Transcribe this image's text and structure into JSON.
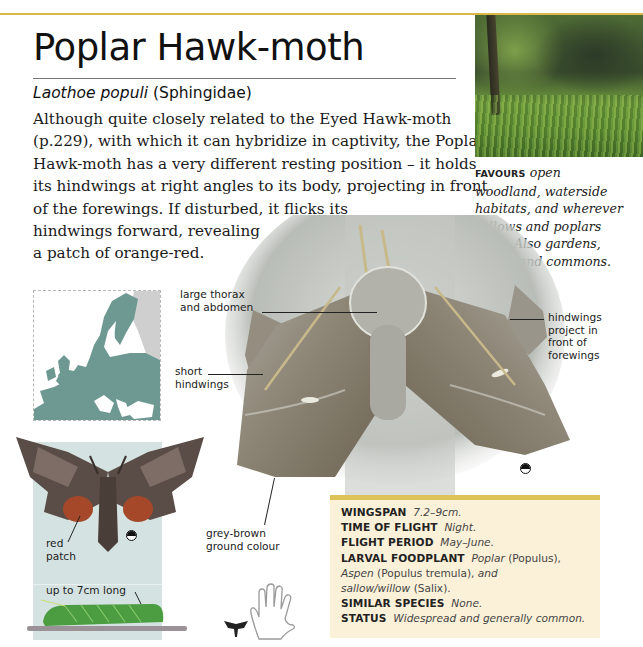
{
  "page": {
    "title": "Poplar Hawk-moth",
    "scientific_name": "Laothoe populi",
    "family": "(Sphingidae)",
    "intro_lines": [
      "Although quite closely related to the Eyed Hawk-moth",
      "(p.229), with which it can hybridize in captivity, the Poplar",
      "Hawk-moth has a very different resting position – it holds",
      "its hindwings at right angles to its body, projecting in front",
      "of the forewings. If disturbed, it flicks its",
      "hindwings forward, revealing",
      "a patch of orange-red."
    ]
  },
  "habitat": {
    "label": "FAVOURS",
    "text_lines": [
      "open",
      "woodland, waterside",
      "habitats, and wherever",
      "sallows and poplars",
      "grow. Also gardens,",
      "parks, and commons."
    ]
  },
  "annotations": {
    "thorax": [
      "large thorax",
      "and abdomen"
    ],
    "short_hindwings": [
      "short",
      "hindwings"
    ],
    "hindwings_project": [
      "hindwings",
      "project in",
      "front of",
      "forewings"
    ],
    "ground_colour": [
      "grey-brown",
      "ground colour"
    ],
    "red_patch": [
      "red",
      "patch"
    ],
    "caterpillar": "up to 7cm long"
  },
  "facts": [
    {
      "key": "WINGSPAN",
      "value": "7.2–9cm."
    },
    {
      "key": "TIME OF FLIGHT",
      "value": "Night."
    },
    {
      "key": "FLIGHT PERIOD",
      "value": "May–June."
    },
    {
      "key": "LARVAL FOODPLANT",
      "value_parts": [
        "Poplar",
        " (Populus),",
        "Aspen",
        " (Populus tremula), ",
        "and",
        "sallow/willow",
        " (Salix)."
      ]
    },
    {
      "key": "SIMILAR SPECIES",
      "value": "None."
    },
    {
      "key": "STATUS",
      "value": "Widespread and generally common."
    }
  ],
  "icons": {
    "sex_symbol": "half-moon-icon",
    "size_guide": "hand-icon",
    "silhouette": "moth-silhouette-icon"
  },
  "colors": {
    "accent_rule": "#d9b94a",
    "facts_bg": "#fbf1d8",
    "facts_bar": "#dcc257",
    "specimen_bg": "#d4e3e1",
    "map_land": "#6e9892"
  }
}
